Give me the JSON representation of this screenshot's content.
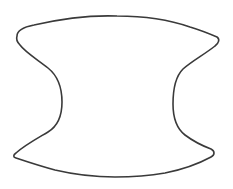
{
  "drawing": {
    "description": "Hand-drawn outline of a symmetric concave-sided shape (like a spool or apple core silhouette) on white background",
    "background_color": "#ffffff",
    "stroke_color": "#3a3a3a",
    "stroke_width": 1.6,
    "fill_color": "none",
    "outline_path": "M 17 36 C 17 30, 24 27, 34 25 C 60 19, 90 15, 117 16 C 145 16, 170 20, 190 27 C 200 30, 210 34, 217 37 C 220 39, 219 43, 215 46 C 205 54, 192 61, 183 69 C 175 77, 173 90, 173 104 C 173 118, 176 128, 185 135 C 193 141, 203 146, 211 149 C 215 151, 215 155, 211 157 C 200 163, 185 169, 165 173 C 148 176, 130 177, 115 177 C 95 177, 72 174, 55 170 C 40 166, 25 161, 16 158 C 13 157, 13 155, 16 153 C 25 145, 38 138, 48 132 C 58 126, 62 115, 62 102 C 62 88, 58 76, 48 68 C 38 60, 25 52, 20 45 C 17 42, 16 39, 17 36 Z"
  }
}
